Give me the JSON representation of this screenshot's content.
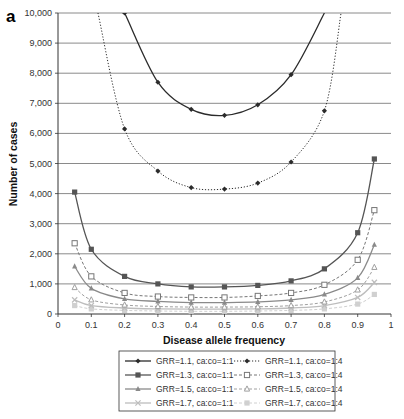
{
  "panel_label": "a",
  "chart_data": {
    "type": "line",
    "title": "",
    "xlabel": "Disease allele frequency",
    "ylabel": "Number of cases",
    "xlim": [
      0,
      1
    ],
    "ylim": [
      0,
      10000
    ],
    "x_ticks": [
      "0",
      "0.1",
      "0.2",
      "0.3",
      "0.4",
      "0.5",
      "0.6",
      "0.7",
      "0.8",
      "0.9",
      "1"
    ],
    "y_ticks": [
      "0",
      "1,000",
      "2,000",
      "3,000",
      "4,000",
      "5,000",
      "6,000",
      "7,000",
      "8,000",
      "9,000",
      "10,000"
    ],
    "grid": "horizontal",
    "legend_position": "bottom",
    "series": [
      {
        "name": "GRR=1.1, ca:co=1:1",
        "style": "solid",
        "marker": "diamond",
        "color": "#2b2b2b",
        "x": [
          0.2,
          0.3,
          0.4,
          0.5,
          0.6,
          0.7
        ],
        "y": [
          10000,
          7700,
          6800,
          6600,
          6950,
          7950
        ],
        "curve_ends": [
          [
            0.195,
            10000
          ],
          [
            0.8,
            10000
          ]
        ]
      },
      {
        "name": "GRR=1.1, ca:co=1:4",
        "style": "dotted",
        "marker": "diamond-open",
        "color": "#2b2b2b",
        "x": [
          0.2,
          0.3,
          0.4,
          0.5,
          0.6,
          0.7,
          0.8
        ],
        "y": [
          6150,
          4750,
          4200,
          4150,
          4350,
          5050,
          6750
        ],
        "curve_ends": [
          [
            0.12,
            10000
          ],
          [
            0.85,
            10000
          ]
        ]
      },
      {
        "name": "GRR=1.3, ca:co=1:1",
        "style": "solid",
        "marker": "square",
        "color": "#555555",
        "x": [
          0.05,
          0.1,
          0.2,
          0.3,
          0.4,
          0.5,
          0.6,
          0.7,
          0.8,
          0.9,
          0.95
        ],
        "y": [
          4050,
          2150,
          1250,
          1000,
          900,
          900,
          950,
          1100,
          1500,
          2700,
          5150
        ]
      },
      {
        "name": "GRR=1.3, ca:co=1:4",
        "style": "dashed",
        "marker": "square-open",
        "color": "#777777",
        "x": [
          0.05,
          0.1,
          0.2,
          0.3,
          0.4,
          0.5,
          0.6,
          0.7,
          0.8,
          0.9,
          0.95
        ],
        "y": [
          2350,
          1250,
          700,
          580,
          550,
          550,
          600,
          700,
          970,
          1800,
          3450
        ]
      },
      {
        "name": "GRR=1.5, ca:co=1:1",
        "style": "solid",
        "marker": "triangle",
        "color": "#8a8a8a",
        "x": [
          0.05,
          0.1,
          0.2,
          0.3,
          0.4,
          0.5,
          0.6,
          0.7,
          0.8,
          0.9,
          0.95
        ],
        "y": [
          1580,
          850,
          500,
          420,
          380,
          380,
          400,
          470,
          650,
          1200,
          2300
        ]
      },
      {
        "name": "GRR=1.5, ca:co=1:4",
        "style": "dashed",
        "marker": "triangle-open",
        "color": "#a0a0a0",
        "x": [
          0.05,
          0.1,
          0.2,
          0.3,
          0.4,
          0.5,
          0.6,
          0.7,
          0.8,
          0.9,
          0.95
        ],
        "y": [
          880,
          470,
          300,
          250,
          230,
          230,
          240,
          280,
          400,
          800,
          1550
        ]
      },
      {
        "name": "GRR=1.7, ca:co=1:1",
        "style": "solid",
        "marker": "x",
        "color": "#bdbdbd",
        "x": [
          0.05,
          0.1,
          0.2,
          0.3,
          0.4,
          0.5,
          0.6,
          0.7,
          0.8,
          0.9,
          0.95
        ],
        "y": [
          470,
          280,
          200,
          170,
          160,
          160,
          170,
          200,
          280,
          550,
          1050
        ]
      },
      {
        "name": "GRR=1.7, ca:co=1:4",
        "style": "dashed",
        "marker": "square-light",
        "color": "#d0d0d0",
        "x": [
          0.05,
          0.1,
          0.2,
          0.3,
          0.4,
          0.5,
          0.6,
          0.7,
          0.8,
          0.9,
          0.95
        ],
        "y": [
          280,
          170,
          120,
          100,
          90,
          90,
          100,
          120,
          170,
          330,
          650
        ]
      }
    ]
  },
  "legend": {
    "items": [
      {
        "label": "GRR=1.1, ca:co=1:1",
        "series": 0
      },
      {
        "label": "GRR=1.1, ca:co=1:4",
        "series": 1
      },
      {
        "label": "GRR=1.3, ca:co=1:1",
        "series": 2
      },
      {
        "label": "GRR=1.3, ca:co=1:4",
        "series": 3
      },
      {
        "label": "GRR=1.5, ca:co=1:1",
        "series": 4
      },
      {
        "label": "GRR=1.5, ca:co=1:4",
        "series": 5
      },
      {
        "label": "GRR=1.7, ca:co=1:1",
        "series": 6
      },
      {
        "label": "GRR=1.7, ca:co=1:4",
        "series": 7
      }
    ]
  }
}
